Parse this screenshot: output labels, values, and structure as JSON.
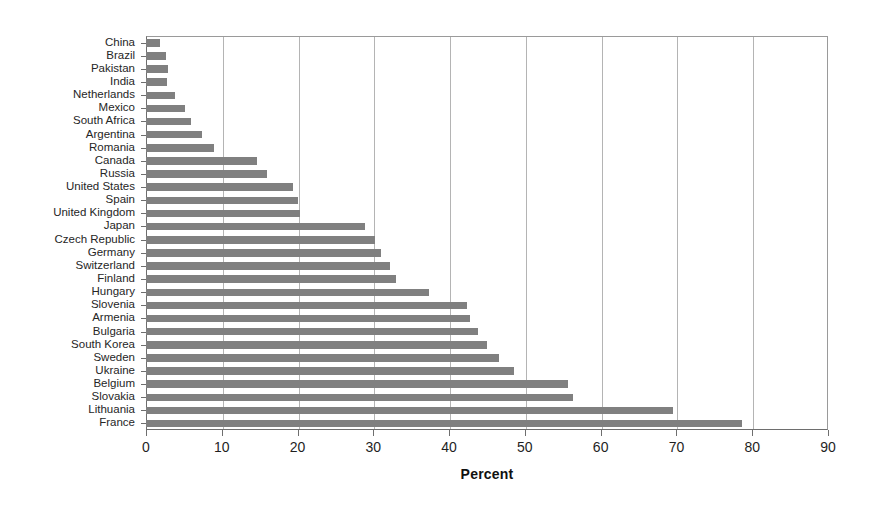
{
  "chart_data": {
    "type": "bar",
    "orientation": "horizontal",
    "title": "",
    "xlabel": "Percent",
    "ylabel": "",
    "xlim": [
      0,
      90
    ],
    "ylim": null,
    "xticks": [
      0,
      10,
      20,
      30,
      40,
      50,
      60,
      70,
      80,
      90
    ],
    "grid": "vertical",
    "legend": null,
    "bar_color": "#808080",
    "categories": [
      "China",
      "Brazil",
      "Pakistan",
      "India",
      "Netherlands",
      "Mexico",
      "South Africa",
      "Argentina",
      "Romania",
      "Canada",
      "Russia",
      "United States",
      "Spain",
      "United Kingdom",
      "Japan",
      "Czech Republic",
      "Germany",
      "Switzerland",
      "Finland",
      "Hungary",
      "Slovenia",
      "Armenia",
      "Bulgaria",
      "South Korea",
      "Sweden",
      "Ukraine",
      "Belgium",
      "Slovakia",
      "Lithuania",
      "France"
    ],
    "values": [
      1.9,
      2.6,
      2.9,
      2.8,
      3.8,
      5.1,
      5.9,
      7.4,
      9.0,
      14.6,
      16.0,
      19.4,
      20.0,
      20.3,
      28.9,
      30.2,
      31.0,
      32.2,
      33.0,
      37.3,
      42.3,
      42.8,
      43.8,
      45.0,
      46.6,
      48.5,
      55.7,
      56.3,
      69.5,
      78.6
    ]
  }
}
